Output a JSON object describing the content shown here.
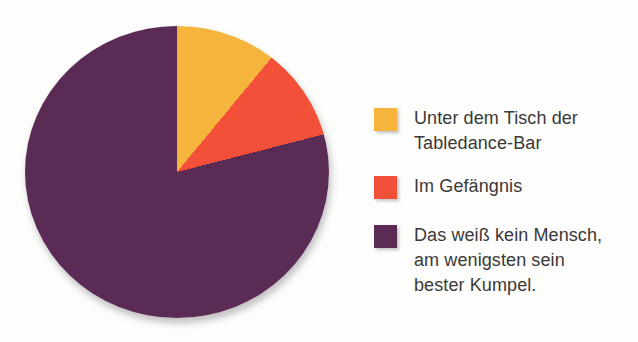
{
  "chart_data": {
    "type": "pie",
    "title": "",
    "start_angle_deg": 0,
    "direction": "clockwise",
    "legend_position": "right",
    "slices": [
      {
        "label": "Unter dem Tisch der Tabledance-Bar",
        "percent": 11,
        "color": "#F5B53C"
      },
      {
        "label": "Im Gefängnis",
        "percent": 10,
        "color": "#F25038"
      },
      {
        "label": "Das weiß kein Mensch, am wenigsten sein bester Kumpel.",
        "percent": 79,
        "color": "#5A2C55"
      }
    ]
  },
  "legend": {
    "items": [
      {
        "label": "Unter dem Tisch der\nTabledance-Bar",
        "color": "#F5B53C"
      },
      {
        "label": "Im Gefängnis",
        "color": "#F25038"
      },
      {
        "label": "Das weiß kein Mensch,\nam wenigsten sein\nbester Kumpel.",
        "color": "#5A2C55"
      }
    ]
  },
  "colors": {
    "background": "#FDFDFC",
    "text": "#3A3938",
    "slice_yellow": "#F5B53C",
    "slice_red": "#F25038",
    "slice_purple": "#5A2C55"
  }
}
